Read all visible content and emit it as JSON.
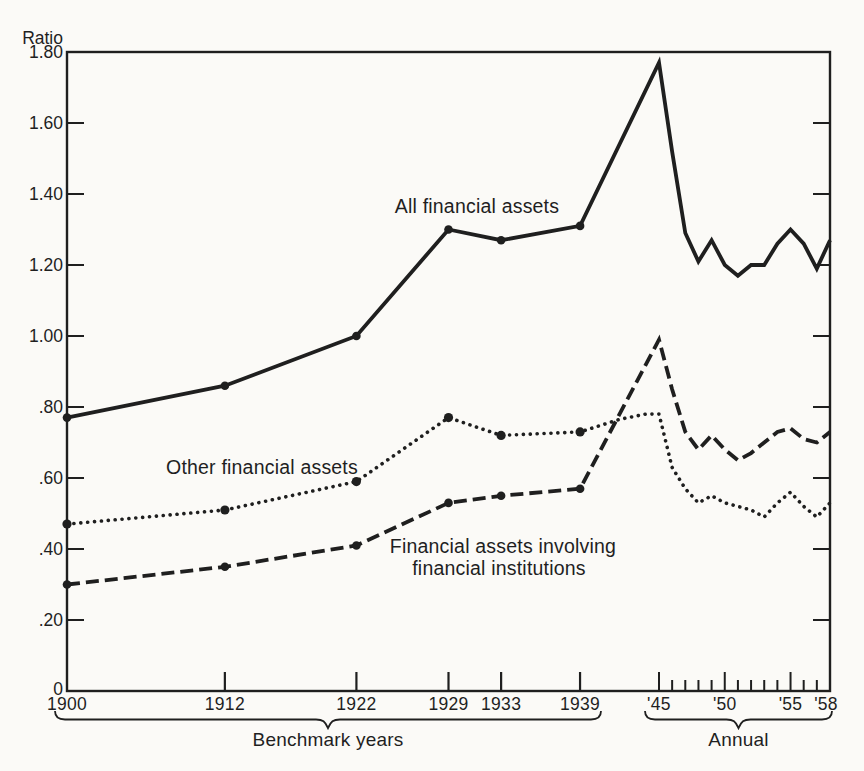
{
  "colors": {
    "ink": "#1f1f1f",
    "paper": "#fbfaf7"
  },
  "chart_data": {
    "type": "line",
    "title": "",
    "y_axis": {
      "label": "Ratio",
      "min": 0,
      "max": 1.8,
      "tick_step": 0.2,
      "ticks": [
        {
          "v": 0.0,
          "label": "0"
        },
        {
          "v": 0.2,
          "label": ".20"
        },
        {
          "v": 0.4,
          "label": ".40"
        },
        {
          "v": 0.6,
          "label": ".60"
        },
        {
          "v": 0.8,
          "label": ".80"
        },
        {
          "v": 1.0,
          "label": "1.00"
        },
        {
          "v": 1.2,
          "label": "1.20"
        },
        {
          "v": 1.4,
          "label": "1.40"
        },
        {
          "v": 1.6,
          "label": "1.60"
        },
        {
          "v": 1.8,
          "label": "1.80"
        }
      ]
    },
    "x_axis": {
      "min_year": 1900,
      "max_year": 1958,
      "benchmark_ticks": [
        {
          "year": 1900,
          "label": "1900"
        },
        {
          "year": 1912,
          "label": "1912"
        },
        {
          "year": 1922,
          "label": "1922"
        },
        {
          "year": 1929,
          "label": "1929"
        },
        {
          "year": 1933,
          "label": "1933"
        },
        {
          "year": 1939,
          "label": "1939"
        }
      ],
      "annual_region": {
        "start_year": 1945,
        "end_year": 1958,
        "major_tick_years": [
          1945,
          1950,
          1955
        ],
        "labeled_ticks": [
          {
            "year": 1945,
            "label": "'45"
          },
          {
            "year": 1950,
            "label": "'50"
          },
          {
            "year": 1955,
            "label": "'55"
          },
          {
            "year": 1958,
            "label": "'58"
          }
        ]
      },
      "group_labels": [
        {
          "text": "Benchmark years",
          "x1": 55,
          "x2": 601
        },
        {
          "text": "Annual",
          "x1": 645,
          "x2": 832
        }
      ]
    },
    "marker_years": [
      1900,
      1912,
      1922,
      1929,
      1933,
      1939
    ],
    "series": [
      {
        "name": "All financial assets",
        "style": "solid",
        "points": [
          [
            1900,
            0.77
          ],
          [
            1912,
            0.86
          ],
          [
            1922,
            1.0
          ],
          [
            1929,
            1.3
          ],
          [
            1933,
            1.27
          ],
          [
            1939,
            1.31
          ],
          [
            1945,
            1.77
          ],
          [
            1946,
            1.52
          ],
          [
            1947,
            1.29
          ],
          [
            1948,
            1.21
          ],
          [
            1949,
            1.27
          ],
          [
            1950,
            1.2
          ],
          [
            1951,
            1.17
          ],
          [
            1952,
            1.2
          ],
          [
            1953,
            1.2
          ],
          [
            1954,
            1.26
          ],
          [
            1955,
            1.3
          ],
          [
            1956,
            1.26
          ],
          [
            1957,
            1.19
          ],
          [
            1958,
            1.27
          ]
        ]
      },
      {
        "name": "Other financial assets",
        "style": "dotted",
        "points": [
          [
            1900,
            0.47
          ],
          [
            1912,
            0.51
          ],
          [
            1922,
            0.59
          ],
          [
            1929,
            0.77
          ],
          [
            1933,
            0.72
          ],
          [
            1939,
            0.73
          ],
          [
            1942,
            0.765
          ],
          [
            1944,
            0.78
          ],
          [
            1945,
            0.78
          ],
          [
            1946,
            0.63
          ],
          [
            1947,
            0.57
          ],
          [
            1948,
            0.53
          ],
          [
            1949,
            0.55
          ],
          [
            1950,
            0.53
          ],
          [
            1951,
            0.52
          ],
          [
            1952,
            0.51
          ],
          [
            1953,
            0.49
          ],
          [
            1954,
            0.53
          ],
          [
            1955,
            0.56
          ],
          [
            1956,
            0.52
          ],
          [
            1957,
            0.49
          ],
          [
            1958,
            0.53
          ]
        ]
      },
      {
        "name": "Financial assets involving financial institutions",
        "style": "dashed",
        "points": [
          [
            1900,
            0.3
          ],
          [
            1912,
            0.35
          ],
          [
            1922,
            0.41
          ],
          [
            1929,
            0.53
          ],
          [
            1933,
            0.55
          ],
          [
            1939,
            0.57
          ],
          [
            1945,
            0.99
          ],
          [
            1946,
            0.85
          ],
          [
            1947,
            0.73
          ],
          [
            1948,
            0.68
          ],
          [
            1949,
            0.72
          ],
          [
            1950,
            0.68
          ],
          [
            1951,
            0.65
          ],
          [
            1952,
            0.67
          ],
          [
            1953,
            0.7
          ],
          [
            1954,
            0.73
          ],
          [
            1955,
            0.74
          ],
          [
            1956,
            0.71
          ],
          [
            1957,
            0.7
          ],
          [
            1958,
            0.73
          ]
        ]
      }
    ],
    "annotations": [
      {
        "text": "All financial assets",
        "x": 477,
        "y": 213
      },
      {
        "text": "Other financial assets",
        "x": 262,
        "y": 474
      },
      {
        "text": "Financial assets involving",
        "x": 503,
        "y": 553
      },
      {
        "text": "financial institutions",
        "x": 499,
        "y": 575
      }
    ]
  }
}
